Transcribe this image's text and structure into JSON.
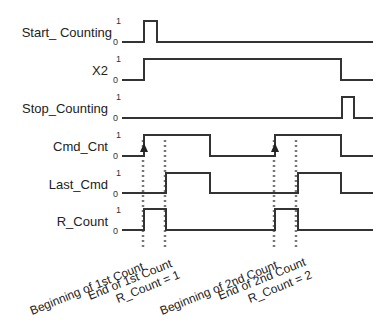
{
  "diagram": {
    "type": "timing_diagram",
    "level_labels": {
      "high": "1",
      "low": "0"
    },
    "signals": [
      {
        "name": "Start_ Counting",
        "y_high": 21,
        "y_low": 42,
        "edges": [
          [
            122,
            0
          ],
          [
            144,
            1
          ],
          [
            157,
            0
          ]
        ]
      },
      {
        "name": "X2",
        "y_high": 59,
        "y_low": 80,
        "edges": [
          [
            122,
            0
          ],
          [
            144,
            1
          ],
          [
            341,
            0
          ]
        ]
      },
      {
        "name": "Stop_Counting",
        "y_high": 97,
        "y_low": 118,
        "edges": [
          [
            122,
            0
          ],
          [
            342,
            1
          ],
          [
            354,
            0
          ]
        ]
      },
      {
        "name": "Cmd_Cnt",
        "y_high": 135,
        "y_low": 156,
        "edges": [
          [
            122,
            0
          ],
          [
            144,
            1
          ],
          [
            210,
            0
          ],
          [
            275,
            1
          ],
          [
            341,
            0
          ]
        ]
      },
      {
        "name": "Last_Cmd",
        "y_high": 173,
        "y_low": 193,
        "edges": [
          [
            122,
            0
          ],
          [
            166,
            1
          ],
          [
            210,
            0
          ],
          [
            298,
            1
          ],
          [
            341,
            0
          ]
        ]
      },
      {
        "name": "R_Count",
        "y_high": 209,
        "y_low": 230,
        "edges": [
          [
            122,
            0
          ],
          [
            144,
            1
          ],
          [
            166,
            0
          ],
          [
            275,
            1
          ],
          [
            298,
            0
          ]
        ]
      }
    ],
    "x_end": 373,
    "markers": [
      {
        "x": 143,
        "arrow_on": "Cmd_Cnt"
      },
      {
        "x": 165
      },
      {
        "x": 274,
        "arrow_on": "Cmd_Cnt"
      },
      {
        "x": 296
      }
    ],
    "annotations": [
      {
        "text": "Beginning of 1st Count"
      },
      {
        "text": "End of 1st Count"
      },
      {
        "text": "R_Count = 1"
      },
      {
        "text": "Beginning of 2nd Count"
      },
      {
        "text": "End of 2nd Count"
      },
      {
        "text": "R_Count = 2"
      }
    ]
  }
}
